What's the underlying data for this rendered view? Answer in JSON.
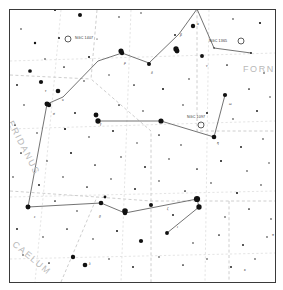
{
  "chart": {
    "type": "star-chart",
    "background_color": "#ffffff",
    "frame_color": "#3a3a3a",
    "star_color": "#111111",
    "constellation_line_color": "#5a5a5a",
    "boundary_color": "#c8c8c8",
    "grid_color": "#d8d8d8"
  },
  "constellation_names": [
    {
      "label": "FORNAX",
      "x": 242,
      "y": 63,
      "rotate": 0
    },
    {
      "label": "ERIDANUS",
      "x": 14,
      "y": 118,
      "rotate": 63
    },
    {
      "label": "CAELUM",
      "x": 16,
      "y": 238,
      "rotate": 40
    }
  ],
  "deep_sky_objects": [
    {
      "name": "NGC 1407",
      "label": "NGC 1407",
      "symbol": "open-circle",
      "x": 67,
      "y": 38,
      "label_x": 74,
      "label_y": 35,
      "r": 3.0
    },
    {
      "name": "NGC 1365",
      "label": "NGC 1365",
      "symbol": "open-circle",
      "x": 240,
      "y": 40,
      "label_x": 208,
      "label_y": 38,
      "r": 3.0
    },
    {
      "name": "NGC 1097",
      "label": "NGC 1097",
      "symbol": "open-circle",
      "x": 200,
      "y": 124,
      "label_x": 186,
      "label_y": 114,
      "r": 3.0
    }
  ],
  "greek_labels": [
    {
      "label": "α",
      "x": 196,
      "y": 21
    },
    {
      "label": "β",
      "x": 179,
      "y": 32
    },
    {
      "label": "ν",
      "x": 205,
      "y": 63
    },
    {
      "label": "δ",
      "x": 150,
      "y": 70
    },
    {
      "label": "μ",
      "x": 123,
      "y": 60
    },
    {
      "label": "ω",
      "x": 228,
      "y": 101
    },
    {
      "label": "τ",
      "x": 44,
      "y": 88
    },
    {
      "label": "υ",
      "x": 61,
      "y": 97
    },
    {
      "label": "σ",
      "x": 52,
      "y": 111
    },
    {
      "label": "γ",
      "x": 99,
      "y": 121
    },
    {
      "label": "η",
      "x": 216,
      "y": 140
    },
    {
      "label": "ε",
      "x": 33,
      "y": 214
    },
    {
      "label": "θ",
      "x": 98,
      "y": 214
    },
    {
      "label": "ζ",
      "x": 166,
      "y": 206
    },
    {
      "label": "ι",
      "x": 176,
      "y": 224
    },
    {
      "label": "λ",
      "x": 88,
      "y": 261
    },
    {
      "label": "π",
      "x": 271,
      "y": 232
    },
    {
      "label": "κ",
      "x": 243,
      "y": 267
    }
  ],
  "chart_data": {
    "type": "scatter",
    "xlabel": "Right Ascension",
    "ylabel": "Declination",
    "grid": true,
    "legend": "none",
    "stars": [
      {
        "x": 54,
        "y": 9,
        "m": 1.4
      },
      {
        "x": 79,
        "y": 14,
        "m": 2.6
      },
      {
        "x": 196,
        "y": 8,
        "m": 1.2
      },
      {
        "x": 118,
        "y": 16,
        "m": 1.0
      },
      {
        "x": 20,
        "y": 28,
        "m": 1.0
      },
      {
        "x": 140,
        "y": 12,
        "m": 0.9
      },
      {
        "x": 34,
        "y": 42,
        "m": 1.5
      },
      {
        "x": 58,
        "y": 37,
        "m": 1.3
      },
      {
        "x": 96,
        "y": 38,
        "m": 0.8
      },
      {
        "x": 192,
        "y": 25,
        "m": 2.8
      },
      {
        "x": 174,
        "y": 34,
        "m": 1.2
      },
      {
        "x": 232,
        "y": 18,
        "m": 1.0
      },
      {
        "x": 259,
        "y": 22,
        "m": 1.4
      },
      {
        "x": 213,
        "y": 47,
        "m": 1.0
      },
      {
        "x": 250,
        "y": 52,
        "m": 1.2
      },
      {
        "x": 44,
        "y": 58,
        "m": 1.0
      },
      {
        "x": 29,
        "y": 70,
        "m": 2.4
      },
      {
        "x": 63,
        "y": 66,
        "m": 1.1
      },
      {
        "x": 88,
        "y": 56,
        "m": 1.3
      },
      {
        "x": 121,
        "y": 52,
        "m": 2.9
      },
      {
        "x": 148,
        "y": 63,
        "m": 2.6
      },
      {
        "x": 176,
        "y": 50,
        "m": 3.2
      },
      {
        "x": 201,
        "y": 55,
        "m": 2.5
      },
      {
        "x": 226,
        "y": 64,
        "m": 1.1
      },
      {
        "x": 263,
        "y": 72,
        "m": 1.0
      },
      {
        "x": 16,
        "y": 84,
        "m": 1.2
      },
      {
        "x": 40,
        "y": 81,
        "m": 2.7
      },
      {
        "x": 57,
        "y": 90,
        "m": 3.0
      },
      {
        "x": 83,
        "y": 80,
        "m": 1.0
      },
      {
        "x": 108,
        "y": 74,
        "m": 0.9
      },
      {
        "x": 133,
        "y": 84,
        "m": 1.1
      },
      {
        "x": 162,
        "y": 88,
        "m": 1.3
      },
      {
        "x": 188,
        "y": 78,
        "m": 1.0
      },
      {
        "x": 224,
        "y": 94,
        "m": 2.7
      },
      {
        "x": 248,
        "y": 88,
        "m": 1.1
      },
      {
        "x": 269,
        "y": 96,
        "m": 0.9
      },
      {
        "x": 23,
        "y": 104,
        "m": 1.0
      },
      {
        "x": 48,
        "y": 104,
        "m": 2.8
      },
      {
        "x": 74,
        "y": 112,
        "m": 1.2
      },
      {
        "x": 95,
        "y": 114,
        "m": 3.1
      },
      {
        "x": 118,
        "y": 104,
        "m": 1.1
      },
      {
        "x": 142,
        "y": 110,
        "m": 1.0
      },
      {
        "x": 160,
        "y": 120,
        "m": 3.3
      },
      {
        "x": 182,
        "y": 104,
        "m": 1.0
      },
      {
        "x": 206,
        "y": 112,
        "m": 1.3
      },
      {
        "x": 232,
        "y": 118,
        "m": 1.0
      },
      {
        "x": 256,
        "y": 110,
        "m": 1.2
      },
      {
        "x": 14,
        "y": 124,
        "m": 1.1
      },
      {
        "x": 36,
        "y": 132,
        "m": 1.0
      },
      {
        "x": 64,
        "y": 128,
        "m": 1.4
      },
      {
        "x": 88,
        "y": 136,
        "m": 1.0
      },
      {
        "x": 112,
        "y": 130,
        "m": 1.2
      },
      {
        "x": 136,
        "y": 142,
        "m": 0.9
      },
      {
        "x": 158,
        "y": 134,
        "m": 1.1
      },
      {
        "x": 180,
        "y": 144,
        "m": 1.0
      },
      {
        "x": 213,
        "y": 136,
        "m": 3.0
      },
      {
        "x": 240,
        "y": 146,
        "m": 1.2
      },
      {
        "x": 262,
        "y": 138,
        "m": 1.0
      },
      {
        "x": 20,
        "y": 152,
        "m": 1.1
      },
      {
        "x": 46,
        "y": 160,
        "m": 1.0
      },
      {
        "x": 70,
        "y": 152,
        "m": 1.3
      },
      {
        "x": 94,
        "y": 164,
        "m": 1.1
      },
      {
        "x": 120,
        "y": 156,
        "m": 1.0
      },
      {
        "x": 144,
        "y": 166,
        "m": 1.2
      },
      {
        "x": 168,
        "y": 158,
        "m": 1.0
      },
      {
        "x": 196,
        "y": 168,
        "m": 1.1
      },
      {
        "x": 220,
        "y": 160,
        "m": 1.3
      },
      {
        "x": 246,
        "y": 170,
        "m": 1.0
      },
      {
        "x": 268,
        "y": 162,
        "m": 0.9
      },
      {
        "x": 12,
        "y": 176,
        "m": 1.0
      },
      {
        "x": 38,
        "y": 184,
        "m": 1.2
      },
      {
        "x": 62,
        "y": 176,
        "m": 1.0
      },
      {
        "x": 86,
        "y": 186,
        "m": 1.1
      },
      {
        "x": 110,
        "y": 178,
        "m": 1.0
      },
      {
        "x": 134,
        "y": 188,
        "m": 1.2
      },
      {
        "x": 158,
        "y": 180,
        "m": 1.0
      },
      {
        "x": 184,
        "y": 190,
        "m": 1.1
      },
      {
        "x": 210,
        "y": 182,
        "m": 1.0
      },
      {
        "x": 236,
        "y": 192,
        "m": 1.3
      },
      {
        "x": 260,
        "y": 184,
        "m": 1.0
      },
      {
        "x": 27,
        "y": 206,
        "m": 3.2
      },
      {
        "x": 54,
        "y": 200,
        "m": 1.1
      },
      {
        "x": 76,
        "y": 210,
        "m": 1.0
      },
      {
        "x": 100,
        "y": 202,
        "m": 3.0
      },
      {
        "x": 104,
        "y": 196,
        "m": 1.8
      },
      {
        "x": 124,
        "y": 212,
        "m": 2.9
      },
      {
        "x": 150,
        "y": 204,
        "m": 2.6
      },
      {
        "x": 172,
        "y": 214,
        "m": 1.2
      },
      {
        "x": 198,
        "y": 206,
        "m": 3.4
      },
      {
        "x": 224,
        "y": 216,
        "m": 1.0
      },
      {
        "x": 248,
        "y": 208,
        "m": 1.1
      },
      {
        "x": 270,
        "y": 218,
        "m": 1.0
      },
      {
        "x": 16,
        "y": 228,
        "m": 1.2
      },
      {
        "x": 42,
        "y": 236,
        "m": 1.0
      },
      {
        "x": 66,
        "y": 228,
        "m": 1.1
      },
      {
        "x": 92,
        "y": 238,
        "m": 1.0
      },
      {
        "x": 116,
        "y": 230,
        "m": 1.3
      },
      {
        "x": 140,
        "y": 240,
        "m": 2.7
      },
      {
        "x": 166,
        "y": 232,
        "m": 2.5
      },
      {
        "x": 192,
        "y": 242,
        "m": 1.0
      },
      {
        "x": 218,
        "y": 234,
        "m": 1.1
      },
      {
        "x": 242,
        "y": 244,
        "m": 1.2
      },
      {
        "x": 266,
        "y": 236,
        "m": 1.0
      },
      {
        "x": 22,
        "y": 254,
        "m": 1.0
      },
      {
        "x": 48,
        "y": 262,
        "m": 1.1
      },
      {
        "x": 72,
        "y": 256,
        "m": 2.8
      },
      {
        "x": 84,
        "y": 264,
        "m": 3.0
      },
      {
        "x": 108,
        "y": 258,
        "m": 1.0
      },
      {
        "x": 132,
        "y": 266,
        "m": 1.2
      },
      {
        "x": 158,
        "y": 256,
        "m": 1.0
      },
      {
        "x": 182,
        "y": 264,
        "m": 1.1
      },
      {
        "x": 206,
        "y": 258,
        "m": 1.0
      },
      {
        "x": 230,
        "y": 266,
        "m": 1.2
      },
      {
        "x": 254,
        "y": 258,
        "m": 1.0
      },
      {
        "x": 196,
        "y": 198,
        "m": 4.0
      },
      {
        "x": 124,
        "y": 210,
        "m": 3.6
      },
      {
        "x": 97,
        "y": 120,
        "m": 3.4
      },
      {
        "x": 46,
        "y": 103,
        "m": 3.2
      },
      {
        "x": 120,
        "y": 50,
        "m": 3.3
      },
      {
        "x": 175,
        "y": 48,
        "m": 3.4
      }
    ],
    "constellation_lines": [
      [
        [
          196,
          8
        ],
        [
          178,
          33
        ]
      ],
      [
        [
          178,
          33
        ],
        [
          148,
          62
        ]
      ],
      [
        [
          148,
          62
        ],
        [
          121,
          52
        ]
      ],
      [
        [
          121,
          52
        ],
        [
          97,
          60
        ]
      ],
      [
        [
          97,
          60
        ],
        [
          62,
          96
        ]
      ],
      [
        [
          62,
          96
        ],
        [
          46,
          103
        ]
      ],
      [
        [
          46,
          103
        ],
        [
          27,
          206
        ]
      ],
      [
        [
          27,
          206
        ],
        [
          100,
          202
        ]
      ],
      [
        [
          100,
          202
        ],
        [
          124,
          212
        ]
      ],
      [
        [
          124,
          212
        ],
        [
          196,
          198
        ]
      ],
      [
        [
          196,
          198
        ],
        [
          198,
          206
        ]
      ],
      [
        [
          198,
          206
        ],
        [
          166,
          232
        ]
      ],
      [
        [
          160,
          120
        ],
        [
          97,
          120
        ]
      ],
      [
        [
          160,
          120
        ],
        [
          213,
          136
        ]
      ],
      [
        [
          213,
          136
        ],
        [
          224,
          94
        ]
      ],
      [
        [
          196,
          8
        ],
        [
          213,
          47
        ]
      ],
      [
        [
          213,
          47
        ],
        [
          250,
          52
        ]
      ]
    ],
    "boundaries": [
      [
        [
          96,
          9
        ],
        [
          90,
          78
        ],
        [
          150,
          130
        ],
        [
          150,
          281
        ]
      ],
      [
        [
          9,
          190
        ],
        [
          96,
          196
        ],
        [
          150,
          200
        ],
        [
          274,
          200
        ]
      ],
      [
        [
          196,
          9
        ],
        [
          196,
          130
        ],
        [
          274,
          130
        ]
      ],
      [
        [
          9,
          74
        ],
        [
          90,
          78
        ]
      ],
      [
        [
          60,
          281
        ],
        [
          96,
          196
        ]
      ],
      [
        [
          228,
          200
        ],
        [
          228,
          281
        ]
      ]
    ],
    "grid_lines": [
      [
        [
          60,
          9
        ],
        [
          34,
          281
        ]
      ],
      [
        [
          130,
          9
        ],
        [
          120,
          281
        ]
      ],
      [
        [
          208,
          9
        ],
        [
          204,
          281
        ]
      ],
      [
        [
          9,
          60
        ],
        [
          274,
          52
        ]
      ],
      [
        [
          9,
          128
        ],
        [
          274,
          120
        ]
      ],
      [
        [
          9,
          196
        ],
        [
          274,
          190
        ]
      ],
      [
        [
          9,
          258
        ],
        [
          274,
          252
        ]
      ]
    ]
  }
}
